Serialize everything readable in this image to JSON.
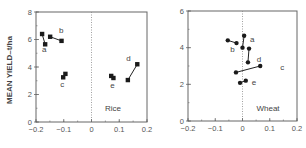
{
  "figure": {
    "ylabel": "MEAN YIELD–t/ha"
  },
  "chart_data": [
    {
      "type": "scatter",
      "title": "Rice",
      "xlabel": "",
      "ylabel": "MEAN YIELD–t/ha",
      "xlim": [
        -0.2,
        0.2
      ],
      "ylim": [
        0,
        8
      ],
      "xticks": [
        "-0.2",
        "-0.1",
        "0",
        "0.1",
        "0.2"
      ],
      "yticks": [
        "0",
        "2",
        "4",
        "6",
        "8"
      ],
      "marker": "square",
      "zero_line": "dotted vertical at x=0",
      "series": [
        {
          "name": "a",
          "points": [
            [
              -0.178,
              6.4
            ],
            [
              -0.167,
              5.65
            ]
          ]
        },
        {
          "name": "b",
          "points": [
            [
              -0.149,
              6.2
            ],
            [
              -0.108,
              5.9
            ]
          ]
        },
        {
          "name": "c",
          "points": [
            [
              -0.102,
              3.25
            ],
            [
              -0.094,
              3.5
            ]
          ]
        },
        {
          "name": "d",
          "points": [
            [
              0.131,
              3.05
            ],
            [
              0.165,
              4.2
            ]
          ]
        },
        {
          "name": "e",
          "points": [
            [
              0.071,
              3.35
            ],
            [
              0.079,
              3.2
            ]
          ]
        }
      ]
    },
    {
      "type": "scatter",
      "title": "Wheat",
      "xlabel": "",
      "ylabel": "",
      "xlim": [
        -0.2,
        0.2
      ],
      "ylim": [
        0,
        6
      ],
      "xticks": [
        "-0.2",
        "-0.1",
        "0",
        "0.1",
        "0.2"
      ],
      "yticks": [
        "0",
        "2",
        "4",
        "6"
      ],
      "marker": "circle",
      "zero_line": "dotted vertical at x=0",
      "series": [
        {
          "name": "a",
          "points": [
            [
              0.006,
              4.65
            ],
            [
              0.0,
              4.0
            ]
          ]
        },
        {
          "name": "b",
          "points": [
            [
              -0.054,
              4.4
            ],
            [
              -0.022,
              4.25
            ]
          ]
        },
        {
          "name": "c",
          "points": [
            [
              -0.024,
              2.65
            ],
            [
              0.065,
              3.0
            ]
          ]
        },
        {
          "name": "d",
          "points": [
            [
              0.024,
              3.95
            ],
            [
              0.02,
              3.2
            ]
          ]
        },
        {
          "name": "e",
          "points": [
            [
              -0.009,
              2.08
            ],
            [
              0.012,
              2.2
            ]
          ]
        }
      ]
    }
  ]
}
